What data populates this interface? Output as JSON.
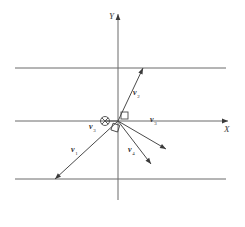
{
  "figure": {
    "background_color": "#ffffff",
    "line_color": "#6b6b6b",
    "vector_color": "#4a4a4a",
    "label_color": "#2e2e2e"
  },
  "axes": {
    "x_label": "X",
    "y_label": "Y",
    "origin": {
      "x": 118,
      "y": 121
    },
    "x_axis": {
      "x1": 15,
      "y1": 121,
      "x2": 228,
      "y2": 121
    },
    "y_axis": {
      "x1": 118,
      "y1": 200,
      "x2": 118,
      "y2": 14
    }
  },
  "reference_lines": [
    {
      "name": "top-horizontal-line",
      "x1": 15,
      "y1": 68,
      "x2": 226,
      "y2": 68
    },
    {
      "name": "bottom-horizontal-line",
      "x1": 15,
      "y1": 179,
      "x2": 226,
      "y2": 179
    }
  ],
  "symbols": {
    "into_page_marker": {
      "name": "circled-x-icon",
      "cx": 105,
      "cy": 121,
      "r": 4.5
    },
    "right_angle_marker": {
      "name": "right-angle-icon",
      "x": 121,
      "y": 112,
      "size": 7
    },
    "origin_square_marker": {
      "name": "origin-square-icon",
      "x": 112,
      "y": 124,
      "size": 7
    }
  },
  "vectors": [
    {
      "id": "v1",
      "label": "v",
      "subscript": "1",
      "start": {
        "x": 118,
        "y": 121
      },
      "end": {
        "x": 55,
        "y": 179
      },
      "arrow_at": "end",
      "label_pos": {
        "x": 71,
        "y": 152
      }
    },
    {
      "id": "v2",
      "label": "v",
      "subscript": "2",
      "start": {
        "x": 118,
        "y": 121
      },
      "end": {
        "x": 143,
        "y": 68
      },
      "arrow_at": "end",
      "label_pos": {
        "x": 133,
        "y": 95
      }
    },
    {
      "id": "v3",
      "label": "v",
      "subscript": "3",
      "start": {
        "x": 118,
        "y": 121
      },
      "end": {
        "x": 166,
        "y": 149
      },
      "arrow_at": "end",
      "label_pos": {
        "x": 150,
        "y": 122
      }
    },
    {
      "id": "v4",
      "label": "v",
      "subscript": "4",
      "start": {
        "x": 118,
        "y": 121
      },
      "end": {
        "x": 151,
        "y": 164
      },
      "arrow_at": "end",
      "label_pos": {
        "x": 128,
        "y": 152
      }
    },
    {
      "id": "v5",
      "label": "v",
      "subscript": "3",
      "start": {
        "x": 118,
        "y": 121
      },
      "end": {
        "x": 105,
        "y": 121
      },
      "arrow_at": "none",
      "label_pos": {
        "x": 89,
        "y": 129
      }
    }
  ]
}
